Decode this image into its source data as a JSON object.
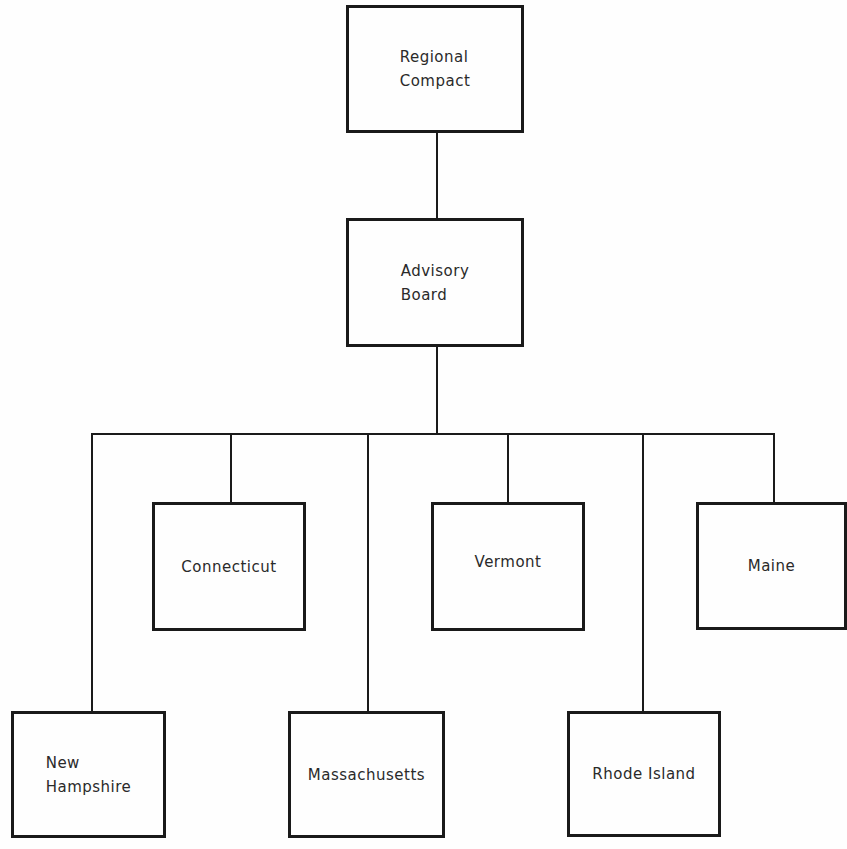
{
  "diagram": {
    "type": "organization-chart",
    "nodes": {
      "regional_compact": {
        "label": "Regional\nCompact"
      },
      "advisory_board": {
        "label": "Advisory\nBoard"
      },
      "connecticut": {
        "label": "Connecticut"
      },
      "vermont": {
        "label": "Vermont"
      },
      "maine": {
        "label": "Maine"
      },
      "new_hampshire": {
        "label": "New\nHampshire"
      },
      "massachusetts": {
        "label": "Massachusetts"
      },
      "rhode_island": {
        "label": "Rhode Island"
      }
    },
    "edges": [
      [
        "Regional Compact",
        "Advisory Board"
      ],
      [
        "Advisory Board",
        "New Hampshire"
      ],
      [
        "Advisory Board",
        "Connecticut"
      ],
      [
        "Advisory Board",
        "Massachusetts"
      ],
      [
        "Advisory Board",
        "Vermont"
      ],
      [
        "Advisory Board",
        "Rhode Island"
      ],
      [
        "Advisory Board",
        "Maine"
      ]
    ],
    "colors": {
      "stroke": "#1a1a1a",
      "text": "#2a2a2a",
      "background": "#fefefe"
    }
  }
}
